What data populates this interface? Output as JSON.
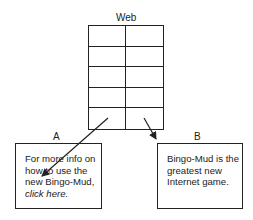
{
  "diagram": {
    "web": {
      "title": "Web",
      "rows": 5,
      "columns": 2
    },
    "page_a": {
      "label": "A",
      "text_line1": "For more info on",
      "text_line2": "how to use the",
      "text_line3": "new Bingo-Mud,",
      "link_text": "click here."
    },
    "page_b": {
      "label": "B",
      "text_line1": "Bingo-Mud is the",
      "text_line2": "greatest new",
      "text_line3": "Internet game."
    },
    "arrows": [
      {
        "from": "web-row-5-col-1",
        "to": "page_a"
      },
      {
        "from": "web-row-5-col-2",
        "to": "page_b"
      }
    ]
  }
}
